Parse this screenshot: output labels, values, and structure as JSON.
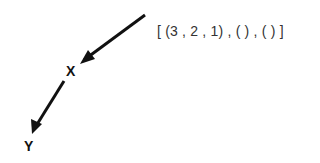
{
  "diagram": {
    "nodes": [
      {
        "id": "X",
        "label": "X"
      },
      {
        "id": "Y",
        "label": "Y"
      }
    ],
    "edges": [
      {
        "from": "entry",
        "to": "X"
      },
      {
        "from": "X",
        "to": "Y"
      }
    ],
    "annotation": "[ (3 , 2 , 1) , ( ) , ( ) ]",
    "colors": {
      "arrow": "#111111",
      "text": "#333333"
    }
  }
}
